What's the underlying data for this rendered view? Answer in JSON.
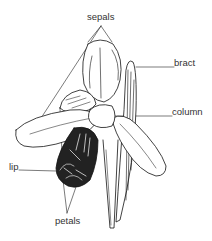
{
  "diagram": {
    "labels": {
      "sepals": "sepals",
      "bract": "bract",
      "column": "column",
      "lip": "lip",
      "petals": "petals"
    },
    "colors": {
      "ink": "#111111",
      "label": "#333333",
      "background": "#ffffff"
    }
  }
}
